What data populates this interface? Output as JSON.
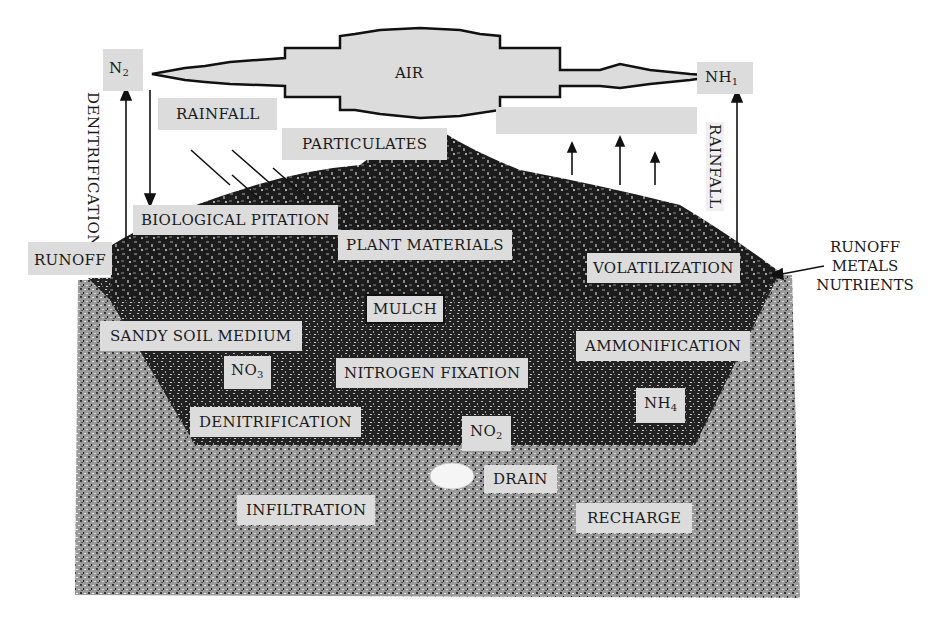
{
  "diagram": {
    "atmosphere": {
      "air_label": "AIR",
      "left_gas": {
        "base": "N",
        "sub": "2"
      },
      "right_gas": {
        "base": "NH",
        "sub": "1"
      }
    },
    "vertical_labels": {
      "left": "DENITRIFICATION",
      "right": "RAINFALL"
    },
    "surface_labels": {
      "rainfall": "RAINFALL",
      "particulates": "PARTICULATES",
      "biological": "BIOLOGICAL PITATION",
      "plant_materials": "PLANT MATERIALS",
      "runoff_left": "RUNOFF",
      "volatilization": "VOLATILIZATION",
      "mulch": "MULCH"
    },
    "side_note": {
      "line1": "RUNOFF",
      "line2": "METALS",
      "line3": "NUTRIENTS"
    },
    "soil_labels": {
      "sandy_soil": "SANDY SOIL MEDIUM",
      "ammonification": "AMMONIFICATION",
      "nitrogen_fixation": "NITROGEN FIXATION",
      "denitrification": "DENITRIFICATION",
      "no3": {
        "base": "NO",
        "sub": "3"
      },
      "no2": {
        "base": "NO",
        "sub": "2"
      },
      "nh4": {
        "base": "NH",
        "sub": "4"
      }
    },
    "subsoil_labels": {
      "drain": "DRAIN",
      "infiltration": "INFILTRATION",
      "recharge": "RECHARGE"
    },
    "colors": {
      "label_bg": "#dcdcdc",
      "ink": "#1a1a1a",
      "background": "#ffffff"
    }
  }
}
